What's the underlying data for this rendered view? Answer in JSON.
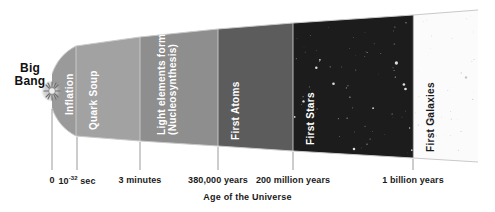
{
  "figure": {
    "axis_caption": "Age of the Universe",
    "origin_label_line1": "Big",
    "origin_label_line2": "Bang"
  },
  "chart_data": {
    "type": "diagram-timeline",
    "title": "",
    "xlabel": "Age of the Universe",
    "ylabel": "",
    "grid": false,
    "legend": "none",
    "eras": [
      {
        "label": "Inflation",
        "label_lines": [
          "Inflation"
        ],
        "x_start_px": 52,
        "x_end_px": 76,
        "fill": "#9a9a9a",
        "text_color": "#ffffff",
        "starfield": false
      },
      {
        "label": "Quark Soup",
        "label_lines": [
          "Quark Soup"
        ],
        "x_start_px": 76,
        "x_end_px": 140,
        "fill": "#a2a2a2",
        "text_color": "#ffffff",
        "starfield": false
      },
      {
        "label": "Light elements form (Nucleosynthesis)",
        "label_lines": [
          "Light elements form",
          "(Nucleosynthesis)"
        ],
        "x_start_px": 140,
        "x_end_px": 218,
        "fill": "#8e8e8e",
        "text_color": "#ffffff",
        "starfield": false
      },
      {
        "label": "First Atoms",
        "label_lines": [
          "First Atoms"
        ],
        "x_start_px": 218,
        "x_end_px": 293,
        "fill": "#5c5c5c",
        "text_color": "#ffffff",
        "starfield": false
      },
      {
        "label": "First Stars",
        "label_lines": [
          "First Stars"
        ],
        "x_start_px": 293,
        "x_end_px": 413,
        "fill": "#1c1c1c",
        "text_color": "#ffffff",
        "starfield": true
      },
      {
        "label": "First Galaxies",
        "label_lines": [
          "First Galaxies"
        ],
        "x_start_px": 413,
        "x_end_px": 478,
        "fill": "#fbfbfb",
        "text_color": "#1a1a1a",
        "starfield": true
      }
    ],
    "ticks": [
      {
        "label": "0",
        "label_html": "0",
        "x_px": 52
      },
      {
        "label": "10^-32 sec",
        "label_html": "10<sup>-32</sup> sec",
        "x_px": 77
      },
      {
        "label": "3 minutes",
        "label_html": "3 minutes",
        "x_px": 140
      },
      {
        "label": "380,000 years",
        "label_html": "380,000 years",
        "x_px": 218
      },
      {
        "label": "200 million years",
        "label_html": "200 million years",
        "x_px": 293
      },
      {
        "label": "1 billion years",
        "label_html": "1 billion years",
        "x_px": 413
      }
    ],
    "colors": {
      "background": "#ffffff",
      "axis_line": "#b0b0b0",
      "tick_mark": "#9a9a9a",
      "text": "#1a1a1a"
    }
  }
}
